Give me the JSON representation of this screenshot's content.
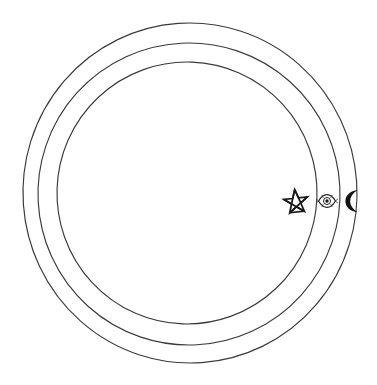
{
  "figure": {
    "background_color": "#ffffff",
    "stroke_color": "#3a3a3a",
    "glyph_color": "#131313",
    "width": 377,
    "height": 385
  },
  "rings": [
    {
      "name": "outer-ring",
      "label": "Outer circle",
      "center_x": 190,
      "center_y": 193,
      "radius_x": 167,
      "radius_y": 170,
      "rotation": -4
    },
    {
      "name": "middle-ring",
      "label": "Middle circle",
      "center_x": 189,
      "center_y": 194,
      "radius_x": 151,
      "radius_y": 151,
      "rotation": -3
    },
    {
      "name": "inner-ring",
      "label": "Inner circle",
      "center_x": 187,
      "center_y": 193,
      "radius_x": 130,
      "radius_y": 131,
      "rotation": 2
    }
  ],
  "symbols": [
    {
      "name": "pentagram-star-icon",
      "label": "Pentagram star",
      "glyph": "✪",
      "center_x": 296,
      "center_y": 202,
      "size": 24,
      "style": "outline"
    },
    {
      "name": "eye-icon",
      "label": "Eye",
      "glyph": "٩",
      "center_x": 327,
      "center_y": 201,
      "size": 15,
      "style": "outline"
    },
    {
      "name": "crescent-moon-icon",
      "label": "Crescent moon",
      "glyph": "☾",
      "center_x": 352,
      "center_y": 201,
      "size": 23,
      "style": "filled"
    }
  ],
  "caption": {
    "alt_text": "Three nested circles drawn by hand, with a pentagram, an eye and a crescent moon lined up on the right side"
  }
}
